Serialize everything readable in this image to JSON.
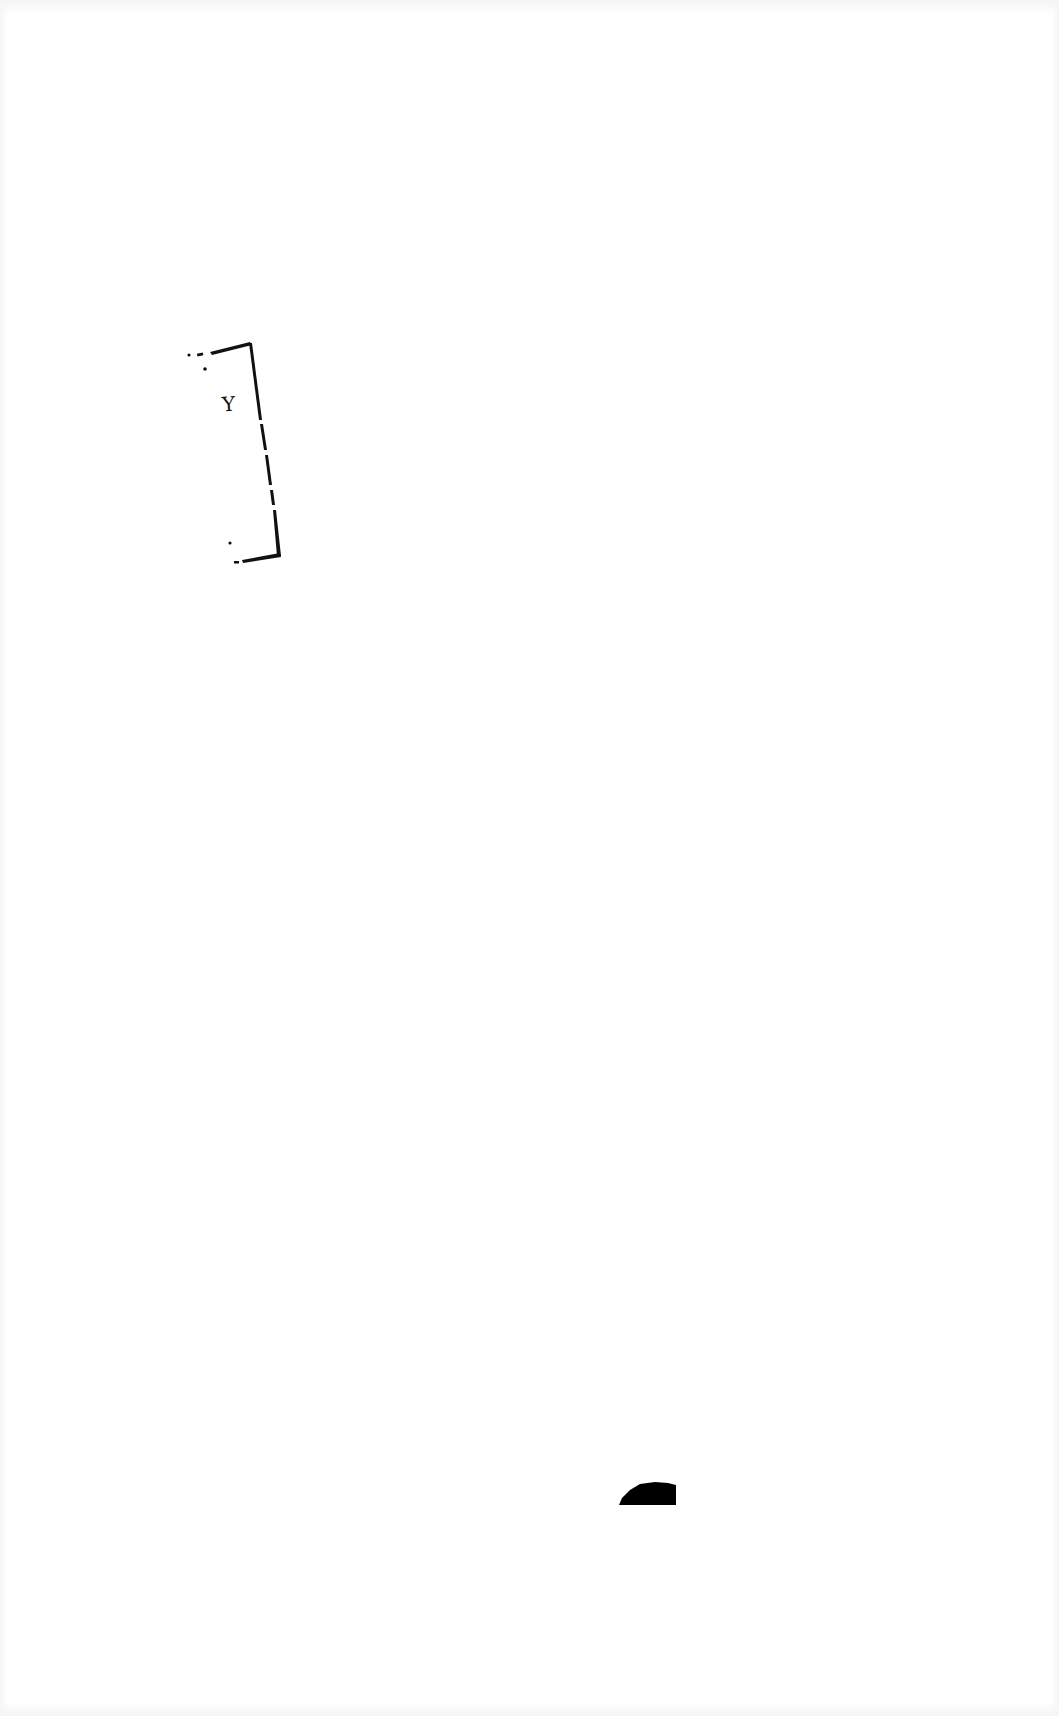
{
  "page": {
    "background": "#ffffff",
    "ink_color": "#111111"
  },
  "bracket": {
    "label": "Y"
  },
  "blob": {
    "color": "#000000"
  }
}
